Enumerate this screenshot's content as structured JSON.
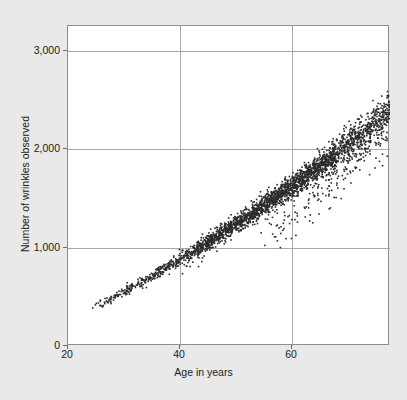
{
  "chart_data": {
    "type": "scatter",
    "title": "",
    "xlabel": "Age in years",
    "ylabel": "Number of wrinkles observed",
    "xlim": [
      20,
      77.5
    ],
    "ylim": [
      0,
      3250
    ],
    "xticks": [
      "20",
      "40",
      "60"
    ],
    "xtick_values": [
      20,
      40,
      60
    ],
    "yticks": [
      "0",
      "1,000",
      "2,000",
      "3,000"
    ],
    "ytick_values": [
      0,
      1000,
      2000,
      3000
    ],
    "grid": true,
    "grid_color": "#a8a8a8",
    "legend": null,
    "marker": "square",
    "marker_color": "#2b2b2b",
    "marker_size": 1.6,
    "n_points": 1900,
    "point_count_label": "",
    "background_color": "#e9e9e9",
    "plot_background_color": "#ffffff",
    "frame_color": "#8e8e8e",
    "series": [
      {
        "name": "main band",
        "x_range": [
          24,
          77.5
        ],
        "relation": "y rises from about 380 wrinkles at age 24 to about 2,400 wrinkles at age 77",
        "scatter_sd_range": [
          18,
          95
        ]
      },
      {
        "name": "low outlier arc",
        "x_range": [
          56,
          77
        ],
        "relation": "y rises from about 1,150 wrinkles at age 58 to about 2,150 wrinkles at age 77, lying below the main band"
      }
    ],
    "sample_points": [
      [
        24.2,
        383
      ],
      [
        24.8,
        398
      ],
      [
        25.4,
        412
      ],
      [
        26.0,
        430
      ],
      [
        26.7,
        452
      ],
      [
        27.3,
        470
      ],
      [
        28.0,
        492
      ],
      [
        28.6,
        508
      ],
      [
        29.2,
        525
      ],
      [
        29.9,
        548
      ],
      [
        30.5,
        565
      ],
      [
        31.2,
        588
      ],
      [
        31.8,
        605
      ],
      [
        32.4,
        625
      ],
      [
        33.1,
        648
      ],
      [
        33.7,
        668
      ],
      [
        34.3,
        688
      ],
      [
        35.0,
        710
      ],
      [
        35.6,
        730
      ],
      [
        36.2,
        752
      ],
      [
        36.9,
        772
      ],
      [
        37.5,
        795
      ],
      [
        38.1,
        815
      ],
      [
        38.8,
        838
      ],
      [
        39.4,
        858
      ],
      [
        40.0,
        880
      ],
      [
        40.7,
        902
      ],
      [
        41.3,
        925
      ],
      [
        41.9,
        948
      ],
      [
        42.6,
        970
      ],
      [
        43.2,
        992
      ],
      [
        43.8,
        1015
      ],
      [
        44.5,
        1038
      ],
      [
        45.1,
        1060
      ],
      [
        45.7,
        1082
      ],
      [
        46.4,
        1105
      ],
      [
        47.0,
        1130
      ],
      [
        47.6,
        1152
      ],
      [
        48.3,
        1175
      ],
      [
        48.9,
        1198
      ],
      [
        49.5,
        1222
      ],
      [
        50.2,
        1245
      ],
      [
        50.8,
        1268
      ],
      [
        51.4,
        1292
      ],
      [
        52.1,
        1315
      ],
      [
        52.7,
        1340
      ],
      [
        53.3,
        1362
      ],
      [
        54.0,
        1388
      ],
      [
        54.6,
        1412
      ],
      [
        55.2,
        1435
      ],
      [
        55.9,
        1460
      ],
      [
        56.5,
        1485
      ],
      [
        57.1,
        1510
      ],
      [
        57.8,
        1535
      ],
      [
        58.4,
        1560
      ],
      [
        59.0,
        1585
      ],
      [
        59.7,
        1610
      ],
      [
        60.3,
        1635
      ],
      [
        60.9,
        1662
      ],
      [
        61.6,
        1688
      ],
      [
        62.2,
        1712
      ],
      [
        62.8,
        1740
      ],
      [
        63.5,
        1765
      ],
      [
        64.1,
        1792
      ],
      [
        64.7,
        1818
      ],
      [
        65.4,
        1845
      ],
      [
        66.0,
        1872
      ],
      [
        66.6,
        1898
      ],
      [
        67.3,
        1925
      ],
      [
        67.9,
        1952
      ],
      [
        68.5,
        1980
      ],
      [
        69.2,
        2008
      ],
      [
        69.8,
        2035
      ],
      [
        70.4,
        2062
      ],
      [
        71.1,
        2090
      ],
      [
        71.7,
        2118
      ],
      [
        72.3,
        2145
      ],
      [
        73.0,
        2175
      ],
      [
        73.6,
        2202
      ],
      [
        74.2,
        2232
      ],
      [
        74.9,
        2260
      ],
      [
        75.5,
        2290
      ],
      [
        76.1,
        2320
      ],
      [
        76.8,
        2352
      ],
      [
        77.4,
        2400
      ]
    ]
  }
}
